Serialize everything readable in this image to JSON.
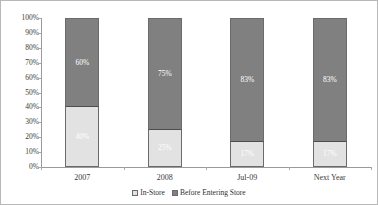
{
  "chart_data": {
    "type": "bar",
    "subtype": "stacked-100-percent",
    "title": "",
    "subtitle": "",
    "xlabel": "",
    "ylabel": "",
    "categories": [
      "2007",
      "2008",
      "Jul-09",
      "Next Year"
    ],
    "series": [
      {
        "name": "In-Store",
        "color": "#e2e2e2",
        "values": [
          40,
          25,
          17,
          17
        ],
        "labels": [
          "40%",
          "25%",
          "17%",
          "17%"
        ]
      },
      {
        "name": "Before Entering Store",
        "color": "#808080",
        "values": [
          60,
          75,
          83,
          83
        ],
        "labels": [
          "60%",
          "75%",
          "83%",
          "83%"
        ]
      }
    ],
    "ylim": [
      0,
      100
    ],
    "ytick_values": [
      100,
      90,
      80,
      70,
      60,
      50,
      40,
      30,
      20,
      10,
      0
    ],
    "ytick_labels": [
      "100%",
      "90%",
      "80%",
      "70%",
      "60%",
      "50%",
      "40%",
      "30%",
      "20%",
      "10%",
      "0%"
    ],
    "grid": false,
    "legend_position": "bottom-center",
    "legend_entries": [
      "In-Store",
      "Before Entering Store"
    ],
    "annotations": []
  },
  "axis": {
    "y_ticks": [
      {
        "label": "100%",
        "value": 100
      },
      {
        "label": "90%",
        "value": 90
      },
      {
        "label": "80%",
        "value": 80
      },
      {
        "label": "70%",
        "value": 70
      },
      {
        "label": "60%",
        "value": 60
      },
      {
        "label": "50%",
        "value": 50
      },
      {
        "label": "40%",
        "value": 40
      },
      {
        "label": "30%",
        "value": 30
      },
      {
        "label": "20%",
        "value": 20
      },
      {
        "label": "10%",
        "value": 10
      },
      {
        "label": "0%",
        "value": 0
      }
    ],
    "x_categories": [
      "2007",
      "2008",
      "Jul-09",
      "Next Year"
    ]
  },
  "bars": [
    {
      "category": "2007",
      "bottom": {
        "series": "In-Store",
        "value": 40,
        "label": "40%"
      },
      "top": {
        "series": "Before Entering Store",
        "value": 60,
        "label": "60%"
      }
    },
    {
      "category": "2008",
      "bottom": {
        "series": "In-Store",
        "value": 25,
        "label": "25%"
      },
      "top": {
        "series": "Before Entering Store",
        "value": 75,
        "label": "75%"
      }
    },
    {
      "category": "Jul-09",
      "bottom": {
        "series": "In-Store",
        "value": 17,
        "label": "17%"
      },
      "top": {
        "series": "Before Entering Store",
        "value": 83,
        "label": "83%"
      }
    },
    {
      "category": "Next Year",
      "bottom": {
        "series": "In-Store",
        "value": 17,
        "label": "17%"
      },
      "top": {
        "series": "Before Entering Store",
        "value": 83,
        "label": "83%"
      }
    }
  ],
  "legend": {
    "items": [
      {
        "label": "In-Store",
        "color": "#e2e2e2"
      },
      {
        "label": "Before Entering Store",
        "color": "#808080"
      }
    ]
  },
  "colors": {
    "series_in_store": "#e2e2e2",
    "series_before_entering_store": "#808080",
    "axis_line": "#9a9a9a",
    "bar_outline": "#6b6b6b",
    "frame": "#b8b8b8",
    "text": "#3a3a3a",
    "data_label_text": "#ffffff",
    "background": "#ffffff"
  }
}
